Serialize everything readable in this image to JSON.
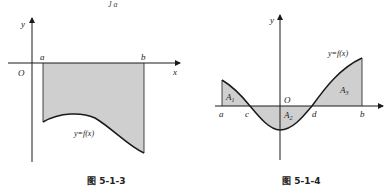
{
  "top_fragment": "J a",
  "figures": [
    {
      "id": "fig-5-1-3",
      "caption": "图 5-1-3",
      "axes": {
        "x_label": "x",
        "y_label": "y",
        "origin_label": "O"
      },
      "points": {
        "a": "a",
        "b": "b"
      },
      "curve_label": "y=f(x)",
      "description": "Curve y=f(x) lies entirely below x-axis on [a,b]; region between curve and x-axis is shaded"
    },
    {
      "id": "fig-5-1-4",
      "caption": "图 5-1-4",
      "axes": {
        "x_label": "x",
        "y_label": "y",
        "origin_label": "O"
      },
      "points": {
        "a": "a",
        "c": "c",
        "d": "d",
        "b": "b"
      },
      "curve_label": "y=f(x)",
      "areas": {
        "A1": "A",
        "A1_sub": "1",
        "A2": "A",
        "A2_sub": "2",
        "A3": "A",
        "A3_sub": "3"
      },
      "description": "Curve y=f(x) above x-axis on [a,c] (area A1), below on [c,d] (area A2), above on [d,b] (area A3)"
    }
  ],
  "colors": {
    "shade": "#cfcfcf",
    "line": "#1a1a1a"
  }
}
